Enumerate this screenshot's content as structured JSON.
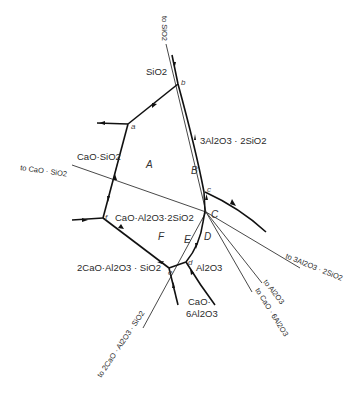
{
  "diagram": {
    "type": "phase-diagram-crystallization-paths",
    "phase_fields": {
      "sio2": "SiO2",
      "mullite": "3Al2O3 · 2SiO2",
      "wollastonite": "CaO·SiO2",
      "anorthite": "CaO·Al2O3·2SiO2",
      "gehlenite": "2CaO·Al2O3 · SiO2",
      "alumina": "Al2O3",
      "ca_hexaluminate_1": "CaO·",
      "ca_hexaluminate_2": "6Al2O3"
    },
    "regions": [
      "A",
      "B",
      "C",
      "D",
      "E",
      "F"
    ],
    "points": [
      "a",
      "b",
      "c",
      "d",
      "e",
      "f"
    ],
    "tie_line_labels": {
      "to_sio2": "to SiO2",
      "to_caosio2": "to CaO · SiO2",
      "to_mullite": "to 3Al2O3 · 2SiO2",
      "to_al2o3": "to Al2O3",
      "to_cao6al2o3": "to CaO · 6Al2O3",
      "to_gehlenite": "to 2CaO · Al2O3 · SiO2"
    },
    "colors": {
      "line": "#111111",
      "background": "#ffffff"
    }
  }
}
